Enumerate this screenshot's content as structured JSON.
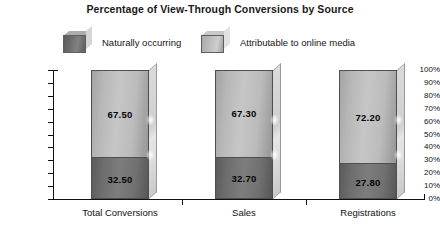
{
  "chart_data": {
    "type": "bar",
    "subtype": "stacked-100-percent-3d",
    "title": "Percentage of View-Through Conversions by Source",
    "xlabel": "",
    "ylabel": "",
    "ylim": [
      0,
      100
    ],
    "ytick_labels": [
      "100%",
      "90%",
      "80%",
      "70%",
      "60%",
      "50%",
      "40%",
      "30%",
      "20%",
      "10%",
      "0%"
    ],
    "ytick_values": [
      100,
      90,
      80,
      70,
      60,
      50,
      40,
      30,
      20,
      10,
      0
    ],
    "grid": false,
    "legend_position": "top",
    "categories": [
      "Total Conversions",
      "Sales",
      "Registrations"
    ],
    "series": [
      {
        "name": "Naturally occurring",
        "color": "#6d6d6d",
        "values": [
          32.5,
          32.7,
          27.8
        ],
        "labels": [
          "32.50",
          "32.70",
          "27.80"
        ]
      },
      {
        "name": "Attributable to online media",
        "color": "#c0c0c0",
        "values": [
          67.5,
          67.3,
          72.2
        ],
        "labels": [
          "67.50",
          "67.30",
          "72.20"
        ]
      }
    ]
  },
  "legend": {
    "items": [
      {
        "label": "Naturally occurring",
        "swatch": "dark-gray-3d-box"
      },
      {
        "label": "Attributable to online media",
        "swatch": "light-gray-3d-box"
      }
    ]
  },
  "colors": {
    "background": "#ffffff",
    "axis": "#111111",
    "text": "#111111",
    "series_naturally_occurring": "#6d6d6d",
    "series_attributable_online": "#c0c0c0"
  }
}
